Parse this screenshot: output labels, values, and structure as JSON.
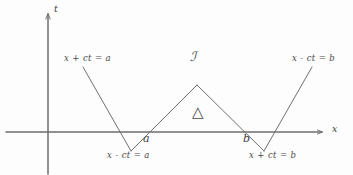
{
  "figure": {
    "kind": "hand-drawn spacetime characteristic diagram",
    "background_color": "#fdfdfd",
    "ink_color": "#555555"
  },
  "axes": {
    "horizontal": {
      "label": "x",
      "label_x": 332,
      "label_y": 124,
      "y_pixel": 132,
      "x_start": 6,
      "x_end": 322,
      "arrow": true
    },
    "vertical": {
      "label": "t",
      "label_x": 54,
      "label_y": 4,
      "x_pixel": 48,
      "y_start": 14,
      "y_end": 173,
      "arrow": true
    }
  },
  "points": [
    {
      "name": "a",
      "label": "a",
      "x": 148,
      "y": 132,
      "label_x": 143,
      "label_y": 133
    },
    {
      "name": "b",
      "label": "b",
      "x": 247,
      "y": 132,
      "label_x": 243,
      "label_y": 133
    }
  ],
  "characteristics": [
    {
      "name": "left-backward-characteristic",
      "equation": "x + ct = a",
      "from": {
        "x": 83,
        "y": 67
      },
      "to": {
        "x": 131,
        "y": 151
      },
      "label_x": 64,
      "label_y": 54
    },
    {
      "name": "left-forward-characteristic",
      "equation": "x - ct = a",
      "from": {
        "x": 131,
        "y": 151
      },
      "to": {
        "x": 197,
        "y": 85
      },
      "label_x": 107,
      "label_y": 151
    },
    {
      "name": "right-forward-characteristic",
      "equation": "x - ct = b",
      "from": {
        "x": 264,
        "y": 151
      },
      "to": {
        "x": 312,
        "y": 67
      },
      "label_x": 292,
      "label_y": 54
    },
    {
      "name": "right-backward-characteristic",
      "equation": "x + ct = b",
      "from": {
        "x": 197,
        "y": 85
      },
      "to": {
        "x": 264,
        "y": 151
      },
      "label_x": 249,
      "label_y": 151
    }
  ],
  "triangle": {
    "name": "characteristic-triangle",
    "apex": {
      "x": 197,
      "y": 85
    },
    "left_base": {
      "x": 148,
      "y": 132
    },
    "right_base": {
      "x": 247,
      "y": 132
    }
  },
  "region_labels": [
    {
      "name": "region-J",
      "text": "ℐ",
      "x": 190,
      "y": 50
    },
    {
      "name": "triangle-glyph",
      "text": "△",
      "x": 192,
      "y": 105
    }
  ]
}
